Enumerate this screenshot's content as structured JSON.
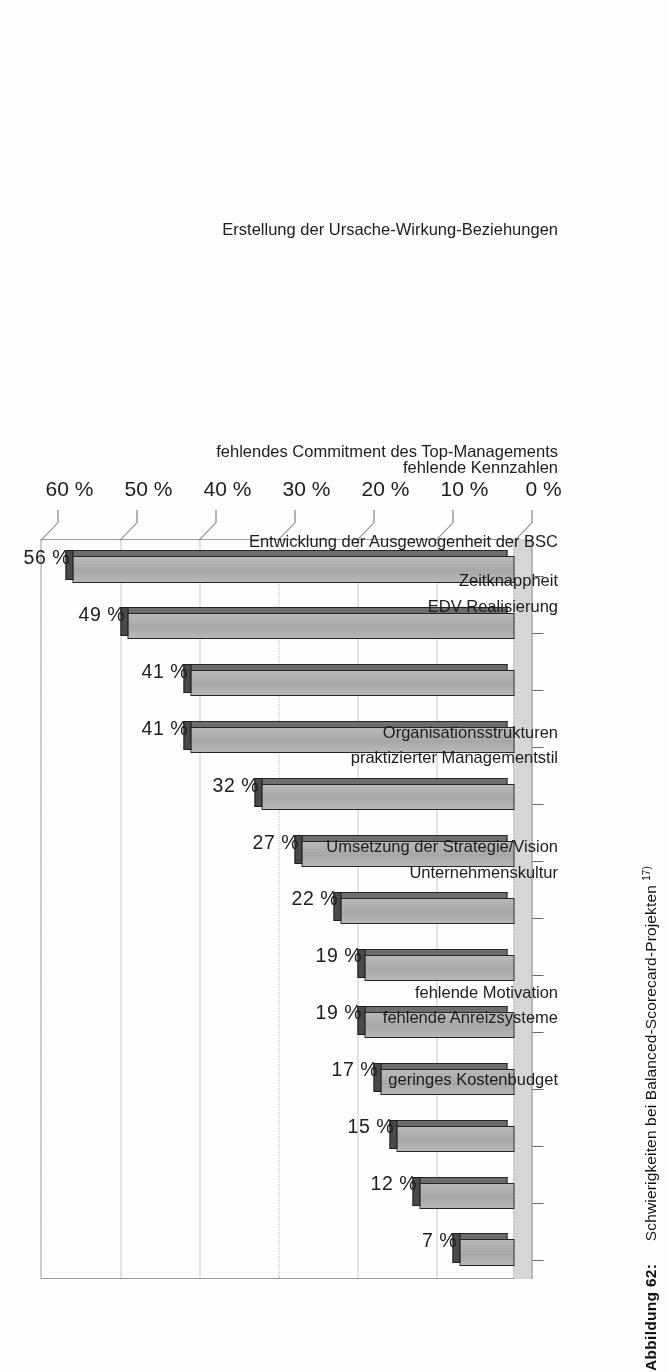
{
  "chart_data": {
    "type": "bar",
    "title": "",
    "xlabel": "",
    "ylabel": "",
    "ylim": [
      0,
      60
    ],
    "grid": true,
    "legend": "none",
    "orientation": "vertical-bars-rotated-90",
    "value_suffix": " %",
    "categories": [
      "geringes Kostenbudget",
      "fehlende Anreizsysteme",
      "fehlende Motivation",
      "Umsetzung der Strategie/Vision",
      "Unternehmenskultur",
      "praktizierter Managementstil",
      "Organisationsstrukturen",
      "Entwicklung der Ausgewogenheit der BSC",
      "fehlendes Commitment des Top-Managements",
      "EDV-Realisierung",
      "Zeitknappheit",
      "fehlende Kennzahlen",
      "Erstellung der Ursache-Wirkung-Beziehungen"
    ],
    "values": [
      7,
      12,
      15,
      17,
      19,
      19,
      22,
      27,
      32,
      41,
      41,
      49,
      56
    ],
    "value_labels": [
      "7 %",
      "12 %",
      "15 %",
      "17 %",
      "19 %",
      "19 %",
      "22 %",
      "27 %",
      "32 %",
      "41 %",
      "41 %",
      "49 %",
      "56 %"
    ],
    "axis_ticks": [
      0,
      10,
      20,
      30,
      40,
      50,
      60
    ],
    "axis_tick_labels": [
      "0 %",
      "10 %",
      "20 %",
      "30 %",
      "40 %",
      "50 %",
      "60 %"
    ],
    "colors": {
      "bar_face": "#b0b0b0",
      "bar_outline": "#262626",
      "bar_side": "#6e6e6e",
      "bar_top": "#4a4a4a",
      "gridline": "#c9c9c9",
      "floor": "#d7d7d7",
      "text": "#1d1d1d"
    }
  },
  "caption": {
    "number": "Abbildung 62:",
    "text": "Schwierigkeiten bei Balanced-Scorecard-Projekten",
    "footnote": "17)"
  }
}
